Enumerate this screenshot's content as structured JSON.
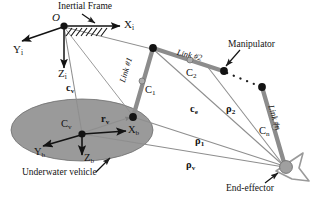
{
  "figure": {
    "background": "#ffffff",
    "ink": "#131313",
    "vehicle_fill": "#9a9a9a",
    "link_color": "#8c8c8c",
    "vector_color": "#8e8e8e"
  },
  "labels": {
    "origin": "O",
    "inertial_frame": "Inertial Frame",
    "axis_xi": "X",
    "axis_xi_sub": "i",
    "axis_yi": "Y",
    "axis_yi_sub": "i",
    "axis_zi": "Z",
    "axis_zi_sub": "i",
    "axis_xb": "X",
    "axis_xb_sub": "b",
    "axis_yb": "Y",
    "axis_yb_sub": "b",
    "axis_zb": "Z",
    "axis_zb_sub": "b",
    "vehicle_center": "C",
    "vehicle_center_sub": "v",
    "underwater_vehicle": "Underwater vehicle",
    "manipulator": "Manipulator",
    "end_effector": "End-effector",
    "link1": "Link #1",
    "link2": "Link #2",
    "linkn": "Link #n",
    "com1": "C",
    "com1_sub": "1",
    "com2": "C",
    "com2_sub": "2",
    "comn": "C",
    "comn_sub": "n",
    "vec_cv": "c",
    "vec_cv_sub": "v",
    "vec_ce": "c",
    "vec_ce_sub": "e",
    "vec_rv": "r",
    "vec_rv_sub": "v",
    "vec_rho_v": "ρ",
    "vec_rho_v_sub": "v",
    "vec_rho_1": "ρ",
    "vec_rho_1_sub": "1",
    "vec_rho_2": "ρ",
    "vec_rho_2_sub": "2"
  },
  "geometry": {
    "origin": [
      64,
      26
    ],
    "vehicle_center": [
      82,
      134
    ],
    "base_joint": [
      133,
      117
    ],
    "joint1": [
      153,
      48
    ],
    "joint2": [
      223,
      71
    ],
    "joint3": [
      262,
      87
    ],
    "end_effector": [
      285,
      167
    ],
    "com1": [
      142,
      80
    ],
    "com2": [
      187,
      59
    ],
    "comn": [
      274,
      126
    ]
  }
}
